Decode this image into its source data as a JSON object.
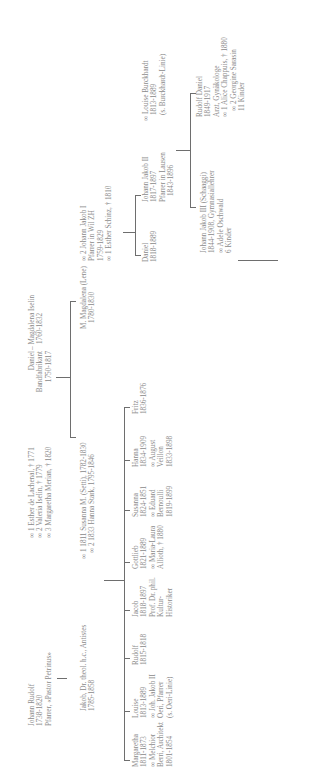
{
  "chart_title": "Isler / Burckhardt family tree (rotated)",
  "generation_1": {
    "johann_rudolf": {
      "lines": [
        "Johann Rudolf",
        "1738-1820",
        "Pfarrer, «Pastor Petrinus»"
      ]
    },
    "johann_rudolf_spouses": {
      "lines": [
        "∞ 1 Esther de Lachenal, † 1771",
        "∞ 2 Valeria Iselin, † 1779",
        "∞ 3 Margaretha Merian, † 1820"
      ]
    },
    "daniel": {
      "lines": [
        "Daniel",
        "Bandfabrikant",
        "1750-1817"
      ]
    },
    "magdalena_iselin": {
      "lines": [
        "– Magdalena Iselin",
        "1760-1832"
      ]
    }
  },
  "generation_2": {
    "jakob": {
      "lines": [
        "Jakob, Dr. theol. h.c., Antistes",
        "1785-1858"
      ]
    },
    "jakob_spouses": {
      "lines": [
        "∞ 1 1811 Susanna M. (Setti), 1782-1830",
        "∞ 2 1833 Hanna Stark, 1795-1846"
      ]
    },
    "m_magdalena": {
      "lines": [
        "M. Magdalena (Lene)",
        "1780-1830"
      ]
    },
    "johann_jakob_i": {
      "lines": [
        "∞ 2 Johann Jakob I",
        "Pfarrer in Wil ZH",
        "1759-1829",
        "∞ 1 Esther Schinz, † 1810"
      ]
    }
  },
  "generation_3_left": [
    {
      "lines": [
        "Margaretha",
        "1811-1873",
        "∞ Melchior",
        "Berri, Architekt",
        "1801-1854"
      ]
    },
    {
      "lines": [
        "Louise",
        "1813-1889",
        "∞ Joh. Jakob II",
        "Oeri, Pfarrer",
        "(s. Oeri-Linie)"
      ]
    },
    {
      "lines": [
        "Rudolf",
        "1815-1818"
      ]
    },
    {
      "lines": [
        "Jacob",
        "1818-1897",
        "Prof. Dr. phil.",
        "Kultur-",
        "Historiker"
      ]
    },
    {
      "lines": [
        "Gottlieb",
        "1821-1889",
        "∞ Maria-Laura",
        "Allioth, † 1880"
      ]
    },
    {
      "lines": [
        "Susanna",
        "1824-1851",
        "∞ Eduard",
        "Bernoulli",
        "1819-1899"
      ]
    },
    {
      "lines": [
        "Hanna",
        "1834-1909",
        "∞ August",
        "Veillon",
        "1833-1898"
      ]
    },
    {
      "lines": [
        "Fritz",
        "1836-1876"
      ]
    }
  ],
  "generation_3_right": [
    {
      "lines": [
        "Daniel",
        "1818-1889"
      ]
    },
    {
      "lines": [
        "Johann Jakob II",
        "1817-1897",
        "Pfarrer in Lausen",
        "1843-1896"
      ]
    },
    {
      "lines": [
        "∞ Louise Burckhardt",
        "1813-1889",
        "(s. Burckhardt-Linie)"
      ]
    }
  ],
  "generation_4": [
    {
      "lines": [
        "Johann Jakob III (Schaaggi)",
        "1844-1908, Gymnasiallehrer",
        "∞ Adele Oschwald",
        "6 Kinder"
      ]
    },
    {
      "lines": [
        "Rudolf Daniel",
        "1849-1917",
        "Arzt, Gynäkologe",
        "∞ 1 Alice Chappuis, † 1880",
        "∞ 2 Georgine Sarasin",
        "11 Kinder"
      ]
    }
  ],
  "colors": {
    "text": "#8a8a8a",
    "line": "#6e6e6e",
    "background": "#ffffff"
  }
}
